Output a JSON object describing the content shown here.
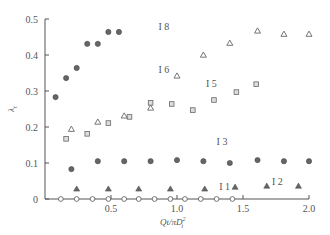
{
  "chart_data": {
    "type": "scatter",
    "title": "",
    "xlabel": "Qt/πD²",
    "xlabel_sub": "t",
    "ylabel": "λ",
    "ylabel_sub": "t",
    "xlim": [
      0,
      2.0
    ],
    "ylim": [
      0,
      0.5
    ],
    "x_ticks": [
      "0.5",
      "1.0",
      "1.5",
      "2.0"
    ],
    "y_ticks": [
      "0",
      "0.1",
      "0.2",
      "0.3",
      "0.4",
      "0.5"
    ],
    "grid": false,
    "legend": "inline labels",
    "series": [
      {
        "name": "I 1",
        "marker": "open-circle",
        "x": [
          0.12,
          0.24,
          0.36,
          0.48,
          0.6,
          0.71,
          0.83,
          0.95,
          1.06,
          1.18,
          1.3,
          1.42
        ],
        "y": [
          0,
          0,
          0,
          0,
          0,
          0,
          0,
          0,
          0,
          0,
          0,
          0
        ]
      },
      {
        "name": "I 2",
        "marker": "filled-triangle",
        "x": [
          0.24,
          0.48,
          0.71,
          0.95,
          1.21,
          1.44,
          1.68,
          1.92
        ],
        "y": [
          0.028,
          0.028,
          0.028,
          0.028,
          0.028,
          0.033,
          0.036,
          0.036
        ]
      },
      {
        "name": "I 3",
        "marker": "filled-circle",
        "x": [
          0.2,
          0.4,
          0.6,
          0.8,
          1.0,
          1.2,
          1.4,
          1.61,
          1.81,
          2.0
        ],
        "y": [
          0.083,
          0.105,
          0.105,
          0.105,
          0.108,
          0.105,
          0.1,
          0.108,
          0.105,
          0.105
        ]
      },
      {
        "name": "I 5",
        "marker": "open-square",
        "x": [
          0.16,
          0.32,
          0.48,
          0.64,
          0.8,
          0.96,
          1.12,
          1.28,
          1.45,
          1.6
        ],
        "y": [
          0.167,
          0.181,
          0.211,
          0.228,
          0.267,
          0.264,
          0.247,
          0.275,
          0.297,
          0.319
        ]
      },
      {
        "name": "I 6",
        "marker": "open-triangle",
        "x": [
          0.2,
          0.4,
          0.6,
          0.8,
          1.0,
          1.2,
          1.4,
          1.61,
          1.81,
          2.0
        ],
        "y": [
          0.194,
          0.214,
          0.231,
          0.253,
          0.342,
          0.4,
          0.433,
          0.467,
          0.458,
          0.458
        ]
      },
      {
        "name": "I 8",
        "marker": "filled-circle",
        "x": [
          0.08,
          0.16,
          0.24,
          0.32,
          0.4,
          0.48,
          0.56
        ],
        "y": [
          0.283,
          0.336,
          0.364,
          0.431,
          0.431,
          0.464,
          0.464
        ]
      }
    ],
    "labels": [
      {
        "text": "I 8",
        "x": 0.86,
        "y": 0.47
      },
      {
        "text": "I 6",
        "x": 0.86,
        "y": 0.35
      },
      {
        "text": "I 5",
        "x": 1.22,
        "y": 0.31
      },
      {
        "text": "I 3",
        "x": 1.3,
        "y": 0.15
      },
      {
        "text": "I 2",
        "x": 1.72,
        "y": 0.04
      },
      {
        "text": "I 1",
        "x": 1.32,
        "y": 0.025
      }
    ]
  },
  "axes": {
    "x_title": "Qt/πD",
    "x_title_sup": "2",
    "x_title_sub": "t",
    "y_title": "λ",
    "y_title_sub": "t"
  }
}
